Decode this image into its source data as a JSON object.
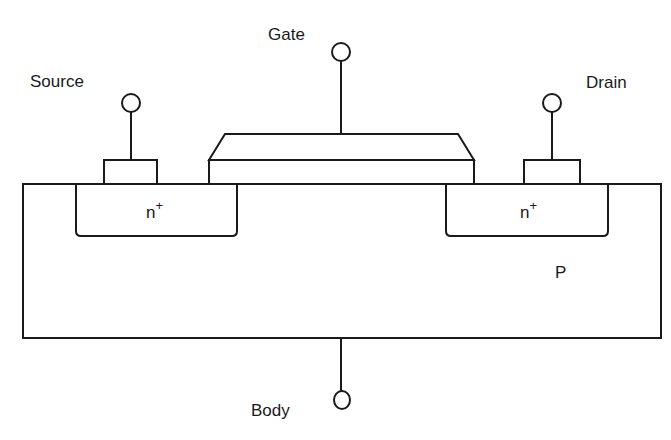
{
  "diagram": {
    "type": "MOSFET cross-section (n-channel)",
    "terminals": {
      "gate": "Gate",
      "source": "Source",
      "drain": "Drain",
      "body": "Body"
    },
    "regions": {
      "source_doping": "n",
      "source_doping_sup": "+",
      "drain_doping": "n",
      "drain_doping_sup": "+",
      "substrate": "P"
    },
    "colors": {
      "stroke": "#1a1a1a",
      "background": "#ffffff"
    }
  }
}
